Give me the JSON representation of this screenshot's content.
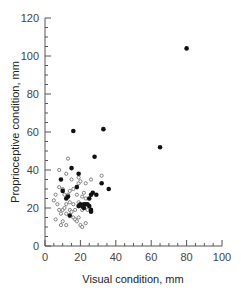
{
  "chart_data": {
    "type": "scatter",
    "title": "",
    "xlabel": "Visual condition, mm",
    "ylabel": "Proprioceptive condition, mm",
    "xlim": [
      0,
      100
    ],
    "ylim": [
      0,
      120
    ],
    "xticks": [
      0,
      20,
      40,
      60,
      80,
      100
    ],
    "yticks": [
      0,
      20,
      40,
      60,
      80,
      100,
      120
    ],
    "grid": false,
    "legend": null,
    "series": [
      {
        "name": "filled",
        "marker": "filled-circle",
        "points": [
          [
            80,
            104
          ],
          [
            65,
            52
          ],
          [
            16,
            60.5
          ],
          [
            33,
            61.5
          ],
          [
            28,
            47
          ],
          [
            9,
            35
          ],
          [
            15,
            41
          ],
          [
            19,
            38
          ],
          [
            10,
            29
          ],
          [
            12,
            25
          ],
          [
            13,
            26
          ],
          [
            18,
            31
          ],
          [
            32,
            33
          ],
          [
            36,
            30
          ],
          [
            29,
            27
          ],
          [
            26,
            27
          ],
          [
            25,
            25
          ],
          [
            27,
            28
          ],
          [
            20,
            22
          ],
          [
            22,
            22
          ],
          [
            23,
            22
          ],
          [
            24,
            22
          ],
          [
            25,
            21
          ],
          [
            26,
            19
          ],
          [
            26,
            18
          ],
          [
            14,
            16
          ],
          [
            19,
            21
          ],
          [
            21,
            21
          ],
          [
            22,
            20
          ]
        ]
      },
      {
        "name": "open",
        "marker": "open-circle",
        "points": [
          [
            13,
            46
          ],
          [
            8,
            40
          ],
          [
            12,
            38
          ],
          [
            19,
            36
          ],
          [
            15,
            35
          ],
          [
            23,
            33
          ],
          [
            8,
            31
          ],
          [
            10,
            30
          ],
          [
            16,
            30
          ],
          [
            14,
            29
          ],
          [
            19,
            33
          ],
          [
            20,
            34
          ],
          [
            26,
            35
          ],
          [
            32,
            37
          ],
          [
            6,
            27
          ],
          [
            11,
            27
          ],
          [
            13,
            27
          ],
          [
            18,
            27
          ],
          [
            21,
            26
          ],
          [
            23,
            25
          ],
          [
            5,
            24
          ],
          [
            12,
            22
          ],
          [
            16,
            22
          ],
          [
            19,
            23
          ],
          [
            8,
            19
          ],
          [
            10,
            19
          ],
          [
            11,
            20
          ],
          [
            14,
            19
          ],
          [
            15,
            18
          ],
          [
            17,
            19
          ],
          [
            21,
            19
          ],
          [
            24,
            19
          ],
          [
            9,
            17
          ],
          [
            12,
            17
          ],
          [
            16,
            15
          ],
          [
            17,
            14
          ],
          [
            19,
            15
          ],
          [
            6,
            14
          ],
          [
            10,
            13
          ],
          [
            18,
            13
          ],
          [
            23,
            12
          ],
          [
            9,
            11
          ],
          [
            12,
            11
          ],
          [
            20,
            11
          ],
          [
            21,
            10
          ],
          [
            14,
            23
          ],
          [
            7,
            22
          ],
          [
            22,
            28
          ]
        ]
      }
    ]
  }
}
